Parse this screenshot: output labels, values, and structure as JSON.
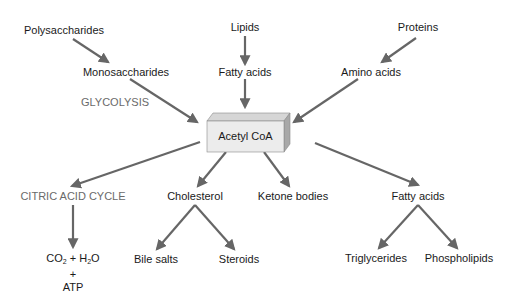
{
  "diagram": {
    "title": "",
    "inputs": [
      {
        "id": "polysaccharides",
        "label": "Polysaccharides"
      },
      {
        "id": "lipids",
        "label": "Lipids"
      },
      {
        "id": "proteins",
        "label": "Proteins"
      }
    ],
    "monomers": [
      {
        "id": "monosaccharides",
        "label": "Monosaccharides"
      },
      {
        "id": "fatty-acids-in",
        "label": "Fatty acids"
      },
      {
        "id": "amino-acids",
        "label": "Amino acids"
      }
    ],
    "pathway_labels": {
      "glycolysis": "GLYCOLYSIS",
      "citric_acid_cycle": "CITRIC ACID CYCLE"
    },
    "center": {
      "label": "Acetyl CoA"
    },
    "outputs": [
      {
        "id": "cholesterol",
        "label": "Cholesterol"
      },
      {
        "id": "ketone-bodies",
        "label": "Ketone bodies"
      },
      {
        "id": "fatty-acids-out",
        "label": "Fatty acids"
      }
    ],
    "end_products": {
      "co2": "CO",
      "co2_sub": "2",
      "plus1": " + H",
      "h2o_sub": "2",
      "o": "O",
      "plus2": "+",
      "atp": "ATP",
      "bile_salts": "Bile salts",
      "steroids": "Steroids",
      "triglycerides": "Triglycerides",
      "phospholipids": "Phospholipids"
    },
    "colors": {
      "arrow": "#666666",
      "box_front": "#ececec",
      "box_top": "#d6d6d6",
      "box_side": "#a8a8a8",
      "pathway_text": "#6a6a6a"
    }
  }
}
